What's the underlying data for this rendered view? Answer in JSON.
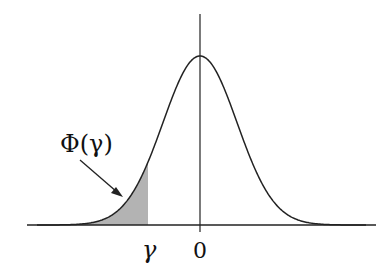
{
  "diagram": {
    "labels": {
      "area_label": "Φ(γ)",
      "gamma_tick": "γ",
      "zero_tick": "0"
    },
    "colors": {
      "curve": "#222222",
      "axis": "#222222",
      "shade": "#b3b3b3"
    },
    "geometry": {
      "x_axis_y": 225,
      "x_axis_from": 27,
      "x_axis_to": 376,
      "y_axis_x": 200,
      "y_axis_top": 14,
      "peak_y": 56,
      "sigma_px": 37,
      "gamma_x": 148
    }
  }
}
